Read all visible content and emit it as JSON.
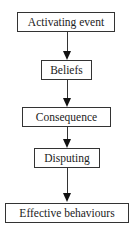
{
  "diagram": {
    "type": "flowchart",
    "direction": "top-to-bottom",
    "nodes": [
      {
        "id": "a",
        "label": "Activating event"
      },
      {
        "id": "b",
        "label": "Beliefs"
      },
      {
        "id": "c",
        "label": "Consequence"
      },
      {
        "id": "d",
        "label": "Disputing"
      },
      {
        "id": "e",
        "label": "Effective behaviours"
      }
    ],
    "edges": [
      {
        "from": "a",
        "to": "b"
      },
      {
        "from": "b",
        "to": "c"
      },
      {
        "from": "c",
        "to": "d"
      },
      {
        "from": "d",
        "to": "e"
      }
    ]
  }
}
